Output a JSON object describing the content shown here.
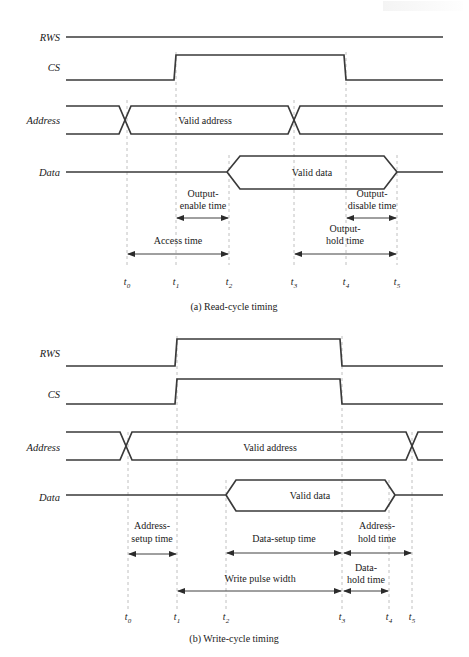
{
  "figure": {
    "title_read": "(a)  Read-cycle timing",
    "title_write": "(b)  Write-cycle timing",
    "colors": {
      "waveform": "#3a3a3a",
      "dashed_marker": "#b9b9b9",
      "annotation_arrow": "#2b2b2b",
      "background": "#ffffff",
      "text": "#1a1a1a"
    }
  },
  "read_cycle": {
    "caption": "(a)  Read-cycle timing",
    "signals": [
      {
        "name": "RWS",
        "label": "RWS",
        "type": "level-high"
      },
      {
        "name": "CS",
        "label": "CS",
        "type": "pulse-high"
      },
      {
        "name": "Address",
        "label": "Address",
        "type": "bus",
        "value": "Valid address"
      },
      {
        "name": "Data",
        "label": "Data",
        "type": "bus",
        "value": "Valid data"
      }
    ],
    "bus_values": {
      "address": "Valid address",
      "data": "Valid data"
    },
    "annotations": [
      {
        "name": "output-enable-time",
        "lines": [
          "Output-",
          "enable time"
        ],
        "from": "t1",
        "to": "t2"
      },
      {
        "name": "output-disable-time",
        "lines": [
          "Output-",
          "disable time"
        ],
        "from": "t4",
        "to": "t5"
      },
      {
        "name": "access-time",
        "lines": [
          "Access time"
        ],
        "from": "t0",
        "to": "t2"
      },
      {
        "name": "output-hold-time",
        "lines": [
          "Output-",
          "hold time"
        ],
        "from": "t3",
        "to": "t5"
      }
    ],
    "time_markers": [
      {
        "name": "t0",
        "base": "t",
        "sub": "0"
      },
      {
        "name": "t1",
        "base": "t",
        "sub": "1"
      },
      {
        "name": "t2",
        "base": "t",
        "sub": "2"
      },
      {
        "name": "t3",
        "base": "t",
        "sub": "3"
      },
      {
        "name": "t4",
        "base": "t",
        "sub": "4"
      },
      {
        "name": "t5",
        "base": "t",
        "sub": "5"
      }
    ]
  },
  "write_cycle": {
    "caption": "(b)  Write-cycle timing",
    "signals": [
      {
        "name": "RWS",
        "label": "RWS",
        "type": "pulse-high"
      },
      {
        "name": "CS",
        "label": "CS",
        "type": "pulse-high"
      },
      {
        "name": "Address",
        "label": "Address",
        "type": "bus",
        "value": "Valid address"
      },
      {
        "name": "Data",
        "label": "Data",
        "type": "bus",
        "value": "Valid data"
      }
    ],
    "bus_values": {
      "address": "Valid address",
      "data": "Valid data"
    },
    "annotations": [
      {
        "name": "address-setup-time",
        "lines": [
          "Address-",
          "setup time"
        ],
        "from": "t0",
        "to": "t1"
      },
      {
        "name": "data-setup-time",
        "lines": [
          "Data-setup time"
        ],
        "from": "t2",
        "to": "t3"
      },
      {
        "name": "address-hold-time",
        "lines": [
          "Address-",
          "hold time"
        ],
        "from": "t3",
        "to": "t5"
      },
      {
        "name": "write-pulse-width",
        "lines": [
          "Write pulse width"
        ],
        "from": "t1",
        "to": "t3"
      },
      {
        "name": "data-hold-time",
        "lines": [
          "Data-",
          "hold time"
        ],
        "from": "t3",
        "to": "t4"
      }
    ],
    "time_markers": [
      {
        "name": "t0",
        "base": "t",
        "sub": "0"
      },
      {
        "name": "t1",
        "base": "t",
        "sub": "1"
      },
      {
        "name": "t2",
        "base": "t",
        "sub": "2"
      },
      {
        "name": "t3",
        "base": "t",
        "sub": "3"
      },
      {
        "name": "t4",
        "base": "t",
        "sub": "4"
      },
      {
        "name": "t5",
        "base": "t",
        "sub": "5"
      }
    ]
  }
}
